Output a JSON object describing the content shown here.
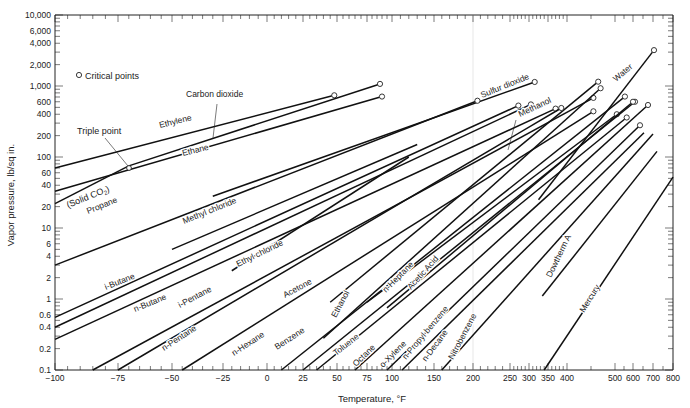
{
  "chart_data": {
    "type": "line",
    "title": "",
    "xlabel": "Temperature, °F",
    "ylabel": "Vapor pressure, lb/sq in.",
    "yscale": "log",
    "ylim": [
      0.1,
      10000
    ],
    "xlim": [
      -100,
      800
    ],
    "grid": false,
    "x_ticks": [
      -100,
      -75,
      -50,
      -25,
      0,
      25,
      50,
      75,
      100,
      150,
      200,
      250,
      300,
      350,
      400,
      500,
      600,
      700,
      800
    ],
    "x_tick_px": [
      55,
      118,
      172,
      223,
      267,
      303,
      337,
      367,
      392,
      434,
      473,
      510,
      529,
      548,
      567,
      615,
      633,
      653,
      673
    ],
    "y_ticks": [
      0.1,
      0.2,
      0.4,
      0.6,
      1,
      2,
      4,
      6,
      10,
      20,
      40,
      60,
      100,
      200,
      400,
      600,
      1000,
      2000,
      4000,
      6000,
      10000
    ],
    "y_tick_labels": [
      "0.1",
      "0.2",
      "0.4",
      "0.6",
      "1",
      "2",
      "4",
      "6",
      "10",
      "20",
      "40",
      "60",
      "100",
      "200",
      "400",
      "600",
      "1,000",
      "2,000",
      "4,000",
      "6,000",
      "10,000"
    ],
    "legend": {
      "symbol": "o",
      "label": "Critical points"
    },
    "annotations": [
      {
        "text": "Triple point",
        "x": -72,
        "y": 75
      },
      {
        "text": "(Solid CO2)",
        "x": -95,
        "y": 25
      }
    ],
    "series": [
      {
        "name": "Ethylene",
        "x": [
          -100,
          48
        ],
        "y": [
          70,
          740
        ],
        "critical": true
      },
      {
        "name": "Carbon dioxide",
        "x": [
          -70,
          88
        ],
        "y": [
          75,
          1070
        ],
        "critical": true
      },
      {
        "name": "Solid CO2",
        "x": [
          -100,
          -70
        ],
        "y": [
          22,
          75
        ],
        "critical": false
      },
      {
        "name": "Ethane",
        "x": [
          -100,
          90
        ],
        "y": [
          33,
          710
        ],
        "critical": true
      },
      {
        "name": "Sulfur dioxide",
        "x": [
          -30,
          315
        ],
        "y": [
          28,
          1140
        ],
        "critical": true
      },
      {
        "name": "Propane",
        "x": [
          -100,
          206
        ],
        "y": [
          3,
          620
        ],
        "critical": true
      },
      {
        "name": "Methyl chloride",
        "x": [
          -50,
          130
        ],
        "y": [
          5,
          150
        ],
        "critical": false
      },
      {
        "name": "i-Butane",
        "x": [
          -100,
          272
        ],
        "y": [
          0.55,
          530
        ],
        "critical": true
      },
      {
        "name": "n-Butane",
        "x": [
          -100,
          305
        ],
        "y": [
          0.4,
          550
        ],
        "critical": true
      },
      {
        "name": "Ethyl chloride",
        "x": [
          -20,
          120
        ],
        "y": [
          2.5,
          100
        ],
        "critical": false
      },
      {
        "name": "i-Pentane",
        "x": [
          -100,
          370
        ],
        "y": [
          0.27,
          480
        ],
        "critical": true
      },
      {
        "name": "Methanol",
        "x": [
          45,
          465
        ],
        "y": [
          0.9,
          1150
        ],
        "critical": true
      },
      {
        "name": "Acetone",
        "x": [
          -85,
          455
        ],
        "y": [
          0.1,
          680
        ],
        "critical": true
      },
      {
        "name": "n-Pentane",
        "x": [
          -75,
          385
        ],
        "y": [
          0.1,
          490
        ],
        "critical": true
      },
      {
        "name": "Water",
        "x": [
          325,
          705
        ],
        "y": [
          25,
          3200
        ],
        "critical": true
      },
      {
        "name": "n-Hexane",
        "x": [
          -45,
          455
        ],
        "y": [
          0.1,
          440
        ],
        "critical": true
      },
      {
        "name": "Ethanol",
        "x": [
          40,
          470
        ],
        "y": [
          0.28,
          930
        ],
        "critical": true
      },
      {
        "name": "Benzene",
        "x": [
          10,
          555
        ],
        "y": [
          0.1,
          710
        ],
        "critical": true
      },
      {
        "name": "n-Heptane",
        "x": [
          75,
          510
        ],
        "y": [
          0.9,
          400
        ],
        "critical": true
      },
      {
        "name": "Toluene",
        "x": [
          25,
          610
        ],
        "y": [
          0.1,
          600
        ],
        "critical": true
      },
      {
        "name": "Acetic Acid",
        "x": [
          95,
          600
        ],
        "y": [
          0.75,
          600
        ],
        "critical": true
      },
      {
        "name": "Octane",
        "x": [
          35,
          565
        ],
        "y": [
          0.1,
          360
        ],
        "critical": true
      },
      {
        "name": "o-Xylene",
        "x": [
          65,
          675
        ],
        "y": [
          0.1,
          540
        ],
        "critical": true
      },
      {
        "name": "n-Propyl benzene",
        "x": [
          95,
          635
        ],
        "y": [
          0.1,
          280
        ],
        "critical": true
      },
      {
        "name": "n-Decane",
        "x": [
          112,
          655
        ],
        "y": [
          0.1,
          220
        ],
        "critical": false
      },
      {
        "name": "Nitrobenzene",
        "x": [
          160,
          700
        ],
        "y": [
          0.1,
          210
        ],
        "critical": false
      },
      {
        "name": "Dowtherm A",
        "x": [
          335,
          720
        ],
        "y": [
          1.1,
          120
        ],
        "critical": false
      },
      {
        "name": "Mercury",
        "x": [
          340,
          800
        ],
        "y": [
          0.1,
          52
        ],
        "critical": false
      }
    ]
  },
  "labels": {
    "legend_text": "Critical points",
    "triple_point": "Triple point",
    "solid_co2": "(Solid CO",
    "solid_co2_sub": "2",
    "solid_co2_close": ")",
    "xlabel": "Temperature, °F",
    "ylabel": "Vapor pressure, lb/sq in."
  }
}
